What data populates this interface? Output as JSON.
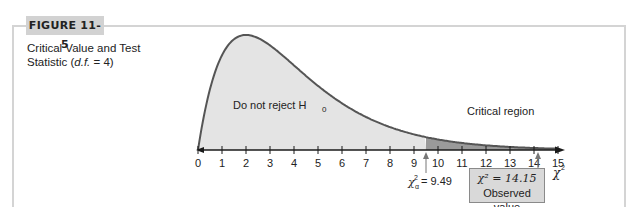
{
  "figure": {
    "label": "FIGURE 11-5",
    "title_line1": "Critical Value and Test",
    "title_line2_prefix": "Statistic (",
    "title_line2_df": "d.f.",
    "title_line2_suffix": " = 4)"
  },
  "annotations": {
    "accept_region_label": "Do not reject H",
    "accept_region_sub": "0",
    "critical_region_label": "Critical region",
    "critical_value_label": "= 9.49",
    "observed_stat": "χ² = 14.15",
    "observed_caption": "Observed value",
    "axis_label": "χ"
  },
  "chart_data": {
    "type": "area",
    "title": "Critical Value and Test Statistic (d.f. = 4)",
    "xlabel": "χ²",
    "ylabel": "",
    "distribution": "chi-square",
    "degrees_of_freedom": 4,
    "x_ticks": [
      0,
      1,
      2,
      3,
      4,
      5,
      6,
      7,
      8,
      9,
      10,
      11,
      12,
      13,
      14,
      15
    ],
    "xlim": [
      0,
      15
    ],
    "grid": false,
    "legend": "none",
    "regions": [
      {
        "name": "Do not reject H0",
        "from": 0,
        "to": 9.49,
        "color": "#e4e4e4"
      },
      {
        "name": "Critical region",
        "from": 9.49,
        "to": 15,
        "color": "#9a9a9a"
      }
    ],
    "critical_value": 9.49,
    "test_statistic": 14.15,
    "colors": {
      "curve": "#555555",
      "accept_fill": "#e4e4e4",
      "critical_fill": "#9a9a9a",
      "box": "#d9d9d9"
    }
  }
}
